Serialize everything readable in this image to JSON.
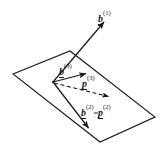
{
  "figure": {
    "background_color": "#ffffff",
    "stroke_color": "#1a1a1a",
    "width": 163,
    "height": 151,
    "labels": {
      "b1": {
        "base": "b",
        "sup": "(1)",
        "text": "b^(1)"
      },
      "b3": {
        "base": "b",
        "sup": "(3)",
        "text": "b^(3)"
      },
      "p3": {
        "base": "p",
        "sup": "(3)",
        "text": "p^(3)"
      },
      "b2p2": {
        "base1": "b",
        "sup1": "(2)",
        "eq": "=",
        "base2": "p",
        "sup2": "(2)",
        "text": "b^(2)=p^(2)"
      }
    },
    "plane": {
      "name": "parallelogram-plane",
      "points": "13,74 70,51 155,117 100,142",
      "stroke": "#1a1a1a",
      "fill": "none"
    },
    "vectors": [
      {
        "name": "vector-b1",
        "style": "solid",
        "x1": 53,
        "y1": 82,
        "x2": 104,
        "y2": 22,
        "label": "b^(1)"
      },
      {
        "name": "vector-b3",
        "style": "solid",
        "x1": 53,
        "y1": 82,
        "x2": 87,
        "y2": 73,
        "label": "b^(3)"
      },
      {
        "name": "vector-p3",
        "style": "dashed",
        "x1": 53,
        "y1": 82,
        "x2": 110,
        "y2": 97,
        "label": "p^(3)"
      },
      {
        "name": "vector-b2p2",
        "style": "solid",
        "x1": 53,
        "y1": 82,
        "x2": 90,
        "y2": 130,
        "label": "b^(2)=p^(2)"
      }
    ]
  }
}
